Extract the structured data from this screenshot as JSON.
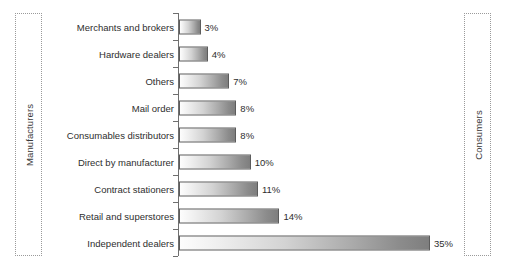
{
  "chart_data": {
    "type": "bar",
    "orientation": "horizontal",
    "title": "",
    "xlabel": "",
    "ylabel": "",
    "grid": false,
    "legend": null,
    "xlim": [
      0,
      35
    ],
    "categories": [
      "Merchants and brokers",
      "Hardware dealers",
      "Others",
      "Mail order",
      "Consumables distributors",
      "Direct by manufacturer",
      "Contract stationers",
      "Retail and superstores",
      "Independent dealers"
    ],
    "values": [
      3,
      4,
      7,
      8,
      8,
      10,
      11,
      14,
      35
    ],
    "value_labels": [
      "3%",
      "4%",
      "7%",
      "8%",
      "8%",
      "10%",
      "11%",
      "14%",
      "35%"
    ],
    "annotations": {
      "left_endpoint": "Manufacturers",
      "right_endpoint": "Consumers"
    }
  },
  "endpoints": {
    "left": {
      "label": "Manufacturers"
    },
    "right": {
      "label": "Consumers"
    }
  },
  "colors": {
    "bar_gradient_start": "#fdfdfd",
    "bar_gradient_end": "#7e7e7e",
    "bar_border": "#5c5c5c",
    "axis": "#6f6f6f",
    "text": "#2e2e2e",
    "endbox_border": "#9a9a9a",
    "background": "#ffffff"
  }
}
